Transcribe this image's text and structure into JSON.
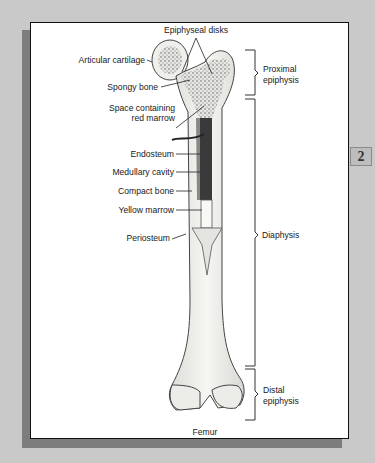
{
  "page_tab": "2",
  "figure_title": "Femur",
  "labels_left": {
    "epiphyseal_disks": "Epiphyseal disks",
    "articular_cartilage": "Articular cartilage",
    "spongy_bone": "Spongy bone",
    "space_red_marrow_line1": "Space containing",
    "space_red_marrow_line2": "red marrow",
    "endosteum": "Endosteum",
    "medullary_cavity": "Medullary cavity",
    "compact_bone": "Compact bone",
    "yellow_marrow": "Yellow marrow",
    "periosteum": "Periosteum"
  },
  "labels_right": {
    "proximal_line1": "Proximal",
    "proximal_line2": "epiphysis",
    "diaphysis": "Diaphysis",
    "distal_line1": "Distal",
    "distal_line2": "epiphysis"
  },
  "colors": {
    "background": "#c9c9c9",
    "panel": "#ffffff",
    "bone_fill": "#f1f1ee",
    "marrow": "#3a3a3a"
  }
}
